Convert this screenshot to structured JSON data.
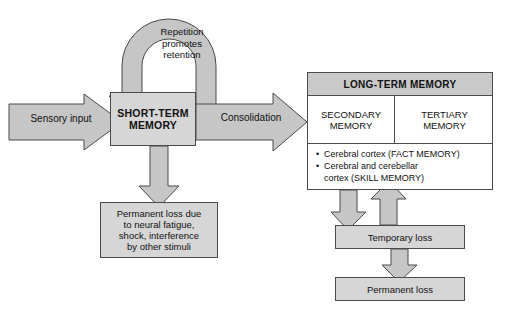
{
  "diagram": {
    "colors": {
      "arrow_fill": "#c6c6c6",
      "box_fill": "#d6d6d6",
      "header_fill": "#c9c9c9",
      "stroke": "#4a4a4a",
      "text": "#111111",
      "background": "#ffffff"
    },
    "nodes": {
      "sensory_input": {
        "label": "Sensory input",
        "shape": "right-arrow"
      },
      "short_term_memory": {
        "label": "SHORT-TERM MEMORY",
        "line1": "SHORT-TERM",
        "line2": "MEMORY",
        "shape": "box"
      },
      "repetition": {
        "label": "Repetition promotes retention",
        "line1": "Repetition",
        "line2": "promotes",
        "line3": "retention",
        "shape": "loop-arrow"
      },
      "consolidation": {
        "label": "Consolidation",
        "shape": "right-arrow"
      },
      "long_term_memory": {
        "header": "LONG-TERM MEMORY",
        "secondary": {
          "line1": "SECONDARY",
          "line2": "MEMORY"
        },
        "tertiary": {
          "line1": "TERTIARY",
          "line2": "MEMORY"
        },
        "bullets": [
          {
            "marker": "•",
            "text": "Cerebral cortex (FACT MEMORY)"
          },
          {
            "marker": "•",
            "text": "Cerebral and cerebellar cortex (SKILL MEMORY)",
            "line1": "Cerebral and cerebellar",
            "line2": "cortex (SKILL MEMORY)"
          }
        ]
      },
      "permanent_loss_left": {
        "line1": "Permanent loss due",
        "line2": "to neural fatigue,",
        "line3": "shock, interference",
        "line4": "by other stimuli",
        "shape": "box"
      },
      "temporary_loss": {
        "label": "Temporary loss",
        "shape": "box"
      },
      "permanent_loss_right": {
        "label": "Permanent loss",
        "shape": "box"
      }
    },
    "edges": [
      {
        "from": "sensory_input",
        "to": "short_term_memory",
        "direction": "right"
      },
      {
        "from": "short_term_memory",
        "to": "short_term_memory",
        "direction": "loop",
        "label": "Repetition promotes retention"
      },
      {
        "from": "short_term_memory",
        "to": "long_term_memory",
        "direction": "right",
        "label": "Consolidation"
      },
      {
        "from": "short_term_memory",
        "to": "permanent_loss_left",
        "direction": "down"
      },
      {
        "from": "secondary_memory",
        "to": "tertiary_memory",
        "direction": "right"
      },
      {
        "from": "long_term_memory",
        "to": "temporary_loss",
        "direction": "down"
      },
      {
        "from": "temporary_loss",
        "to": "long_term_memory",
        "direction": "up"
      },
      {
        "from": "temporary_loss",
        "to": "permanent_loss_right",
        "direction": "down"
      }
    ]
  }
}
